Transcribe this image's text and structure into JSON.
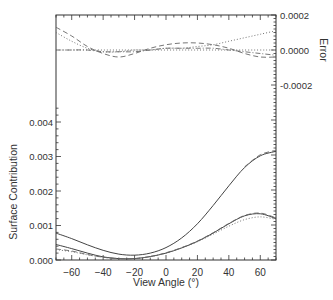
{
  "chart_data": {
    "type": "line",
    "xlabel": "View Angle (°)",
    "x_ticks": [
      -60,
      -40,
      -20,
      0,
      20,
      40,
      60
    ],
    "xlim": [
      -70,
      70
    ],
    "panels": [
      {
        "name": "error",
        "ylabel": "Error",
        "y_axis_side": "right",
        "ylim": [
          -0.0002,
          0.0002
        ],
        "y_ticks": [
          "0.0002",
          "0.0000",
          "-0.0002"
        ],
        "series": [
          {
            "name": "dashed",
            "style": "dashed",
            "x": [
              -70,
              -60,
              -50,
              -40,
              -30,
              -20,
              -10,
              0,
              10,
              20,
              30,
              40,
              50,
              60,
              70
            ],
            "values": [
              0.00013,
              8e-05,
              2e-05,
              -2e-05,
              -4e-05,
              -2e-05,
              1e-05,
              3e-05,
              4e-05,
              4e-05,
              3e-05,
              1e-05,
              -2e-05,
              -4e-05,
              -4e-05
            ]
          },
          {
            "name": "dotted",
            "style": "dotted",
            "x": [
              -70,
              -60,
              -50,
              -40,
              -30,
              -20,
              -10,
              0,
              10,
              20,
              30,
              40,
              50,
              60,
              70
            ],
            "values": [
              0.0001,
              5e-05,
              1e-05,
              -1e-05,
              -1e-05,
              0.0,
              0.0,
              1e-05,
              1e-05,
              2e-05,
              3e-05,
              5e-05,
              7e-05,
              9e-05,
              0.00011
            ]
          },
          {
            "name": "dash-dot",
            "style": "dashdot",
            "x": [
              -70,
              -60,
              -50,
              -40,
              -30,
              -20,
              -10,
              0,
              10,
              20,
              30,
              40,
              50,
              60,
              70
            ],
            "values": [
              0.0,
              0.0,
              0.0,
              -1e-05,
              -1e-05,
              -1e-05,
              0.0,
              1e-05,
              1e-05,
              1e-05,
              1e-05,
              0.0,
              -1e-05,
              -2e-05,
              -3e-05
            ]
          },
          {
            "name": "zero-reference",
            "style": "dotted",
            "x": [
              -70,
              70
            ],
            "values": [
              0.0,
              0.0
            ]
          }
        ]
      },
      {
        "name": "surface",
        "ylabel": "Surface Contribution",
        "y_axis_side": "left",
        "ylim": [
          0.0,
          0.0045
        ],
        "y_ticks": [
          "0.000",
          "0.001",
          "0.002",
          "0.003",
          "0.004"
        ],
        "series": [
          {
            "name": "upper-solid",
            "style": "solid",
            "x": [
              -70,
              -60,
              -50,
              -40,
              -30,
              -20,
              -10,
              0,
              10,
              20,
              30,
              40,
              50,
              60,
              70
            ],
            "values": [
              0.00078,
              0.00062,
              0.00044,
              0.00028,
              0.00017,
              0.00014,
              0.0002,
              0.00036,
              0.00064,
              0.00105,
              0.00158,
              0.00215,
              0.00268,
              0.00302,
              0.00315
            ]
          },
          {
            "name": "lower-solid",
            "style": "solid",
            "x": [
              -70,
              -60,
              -50,
              -40,
              -30,
              -20,
              -10,
              0,
              10,
              20,
              30,
              40,
              50,
              60,
              70
            ],
            "values": [
              0.00045,
              0.00033,
              0.0002,
              9e-05,
              4e-05,
              4e-05,
              0.0001,
              0.0002,
              0.00035,
              0.00054,
              0.00078,
              0.00105,
              0.00128,
              0.00134,
              0.0012
            ]
          },
          {
            "name": "dashed",
            "style": "dashed",
            "x": [
              -70,
              -60,
              -50,
              -40,
              -30,
              -20,
              -10,
              0,
              10,
              20,
              30,
              40,
              50,
              60,
              70
            ],
            "values": [
              0.00032,
              0.00026,
              0.00016,
              8e-05,
              4e-05,
              4e-05,
              0.0001,
              0.00021,
              0.00036,
              0.00055,
              0.00079,
              0.00106,
              0.00129,
              0.00136,
              0.00122
            ]
          },
          {
            "name": "dotted",
            "style": "dotted",
            "x": [
              -70,
              -60,
              -50,
              -40,
              -30,
              -20,
              -10,
              0,
              10,
              20,
              30,
              40,
              50,
              60,
              70
            ],
            "values": [
              0.0003,
              0.00024,
              0.00015,
              8e-05,
              4e-05,
              4e-05,
              0.0001,
              0.0002,
              0.00035,
              0.00053,
              0.00075,
              0.00098,
              0.00117,
              0.00125,
              0.00118
            ]
          },
          {
            "name": "upper-dashed",
            "style": "dashed",
            "x": [
              50,
              60,
              70
            ],
            "values": [
              0.0027,
              0.00305,
              0.00318
            ]
          }
        ]
      }
    ]
  }
}
